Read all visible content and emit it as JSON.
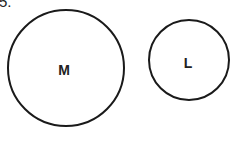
{
  "question_number": "5.",
  "circles": [
    {
      "label": "M",
      "cx": 66,
      "cy": 68,
      "r": 58
    },
    {
      "label": "L",
      "cx": 189,
      "cy": 60,
      "r": 40
    }
  ],
  "colors": {
    "stroke": "#1a1a1a",
    "background": "#ffffff"
  }
}
